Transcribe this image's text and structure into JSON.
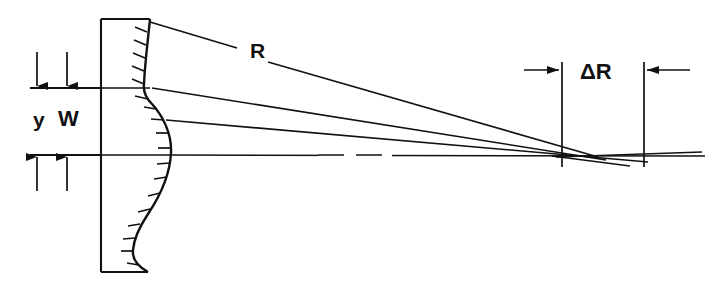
{
  "figure": {
    "kind": "optical-ray-diagram",
    "background_color": "#ffffff",
    "line_color": "#111111",
    "width": 710,
    "height": 295
  },
  "labels": {
    "y": "y",
    "w": "W",
    "r": "R",
    "delta_r": "ΔR"
  },
  "annotations": {
    "y_label_meaning": "aperture height dimension",
    "w_label_meaning": "mirror / window thickness zone dimension",
    "r_label_meaning": "radius of curvature of marginal ray path",
    "delta_r_label_meaning": "longitudinal focal shift between paraxial and marginal foci"
  },
  "geometry": {
    "body": {
      "name": "mirror-substrate",
      "left_x": 101,
      "top_y": 19,
      "bottom_y": 272,
      "top_right_x": 150,
      "bottom_right_x": 148,
      "hatched": true,
      "hatch_count": 18
    },
    "reference_lines": [
      {
        "name": "upper-reference-line",
        "y": 88,
        "x1": 30,
        "x2": 710
      },
      {
        "name": "optical-axis-line",
        "y": 155,
        "x1": 30,
        "x2": 710
      }
    ],
    "dimension_arrows_left": [
      {
        "name": "y-dimension-top-arrow",
        "x": 37,
        "y_from": 52,
        "y_to": 88,
        "direction": "down"
      },
      {
        "name": "w-dimension-top-arrow",
        "x": 67,
        "y_from": 52,
        "y_to": 88,
        "direction": "down"
      },
      {
        "name": "y-dimension-bottom-arrow",
        "x": 37,
        "y_from": 191,
        "y_to": 155,
        "direction": "up"
      },
      {
        "name": "w-dimension-bottom-arrow",
        "x": 67,
        "y_from": 191,
        "y_to": 155,
        "direction": "up"
      }
    ],
    "delta_r": {
      "left_extension_x": 562,
      "right_extension_x": 644,
      "extension_top_y": 62,
      "extension_bottom_y": 167,
      "arrow_y": 70,
      "left_arrow_tail_x": 524,
      "right_arrow_tail_x": 690
    },
    "rays": [
      {
        "name": "marginal-ray-upper",
        "from_x": 150,
        "from_y": 22,
        "to_x": 598,
        "to_y": 157
      },
      {
        "name": "ray-from-upper-edge",
        "from_x": 152,
        "from_y": 88,
        "to_x": 606,
        "to_y": 160
      },
      {
        "name": "ray-mid",
        "from_x": 166,
        "from_y": 120,
        "to_x": 648,
        "to_y": 162
      },
      {
        "name": "axis-ray",
        "from_x": 171,
        "from_y": 155,
        "to_x": 705,
        "to_y": 156
      },
      {
        "name": "focus-crossing-region",
        "x": 560,
        "y": 156
      }
    ],
    "dashed_axis_segment": {
      "x1": 318,
      "x2": 392,
      "y": 155
    }
  },
  "label_positions": {
    "y": {
      "x": 33,
      "y": 127
    },
    "w": {
      "x": 58,
      "y": 126
    },
    "r": {
      "x": 250,
      "y": 58
    },
    "dr": {
      "x": 580,
      "y": 79
    }
  }
}
